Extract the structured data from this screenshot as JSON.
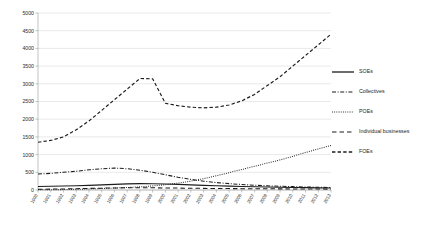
{
  "chart_data": {
    "type": "line",
    "title": "",
    "xlabel": "",
    "ylabel": "",
    "ylim": [
      0,
      5000
    ],
    "ytick_step": 500,
    "grid": true,
    "legend_position": "right",
    "yticks": [
      0,
      500,
      1000,
      1500,
      2000,
      2500,
      3000,
      3500,
      4000,
      4500,
      5000
    ],
    "ytick_labels": [
      "0",
      "500",
      "1000",
      "1500",
      "2000",
      "2500",
      "3000",
      "3500",
      "4000",
      "4500",
      "5000"
    ],
    "categories": [
      "1990",
      "1991",
      "1992",
      "1993",
      "1994",
      "1995",
      "1996",
      "1997",
      "1998",
      "1999",
      "2000",
      "2001",
      "2002",
      "2003",
      "2004",
      "2005",
      "2006",
      "2007",
      "2008",
      "2009",
      "2010",
      "2011",
      "2012",
      "2013"
    ],
    "series": [
      {
        "name": "SOEs",
        "style": "solid",
        "color": "#1c1c1c",
        "values": [
          100,
          105,
          112,
          120,
          130,
          145,
          160,
          172,
          180,
          178,
          170,
          158,
          145,
          132,
          120,
          110,
          100,
          92,
          85,
          78,
          72,
          66,
          60,
          55
        ]
      },
      {
        "name": "Collectives",
        "style": "dash-dot",
        "color": "#1c1c1c",
        "values": [
          450,
          470,
          500,
          530,
          570,
          600,
          620,
          600,
          560,
          500,
          430,
          360,
          300,
          250,
          210,
          180,
          155,
          135,
          118,
          105,
          95,
          85,
          78,
          70
        ]
      },
      {
        "name": "POEs",
        "style": "dotted",
        "color": "#1c1c1c",
        "values": [
          5,
          8,
          12,
          20,
          30,
          42,
          55,
          70,
          90,
          115,
          150,
          195,
          250,
          320,
          400,
          490,
          580,
          670,
          760,
          850,
          950,
          1060,
          1160,
          1260
        ]
      },
      {
        "name": "Individual businesses",
        "style": "long-dash",
        "color": "#1c1c1c",
        "values": [
          20,
          25,
          30,
          38,
          45,
          52,
          58,
          62,
          64,
          62,
          58,
          54,
          50,
          46,
          43,
          40,
          38,
          36,
          34,
          32,
          30,
          28,
          26,
          25
        ]
      },
      {
        "name": "FOEs",
        "style": "dashed",
        "color": "#1c1c1c",
        "values": [
          1350,
          1400,
          1500,
          1700,
          1950,
          2250,
          2550,
          2850,
          3150,
          3140,
          2450,
          2380,
          2340,
          2320,
          2340,
          2400,
          2520,
          2700,
          2950,
          3200,
          3500,
          3800,
          4100,
          4400
        ]
      }
    ]
  },
  "legend": {
    "items": [
      {
        "label": "SOEs",
        "style": "solid"
      },
      {
        "label": "Collectives",
        "style": "dash-dot"
      },
      {
        "label": "POEs",
        "style": "dotted"
      },
      {
        "label": "Individual businesses",
        "style": "long-dash"
      },
      {
        "label": "FOEs",
        "style": "dashed"
      }
    ]
  }
}
